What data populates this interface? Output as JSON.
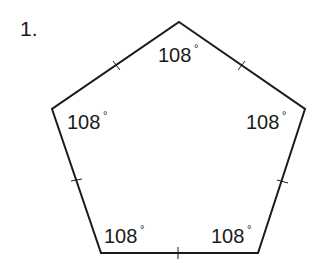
{
  "problem": {
    "number": "1."
  },
  "figure": {
    "shape": "regular pentagon",
    "stroke_color": "#1a1a1a",
    "background": "#ffffff",
    "angles": [
      {
        "vertex": "top",
        "value": "108",
        "unit": "°"
      },
      {
        "vertex": "left",
        "value": "108",
        "unit": "°"
      },
      {
        "vertex": "right",
        "value": "108",
        "unit": "°"
      },
      {
        "vertex": "bottom-left",
        "value": "108",
        "unit": "°"
      },
      {
        "vertex": "bottom-right",
        "value": "108",
        "unit": "°"
      }
    ],
    "congruence_tick_marks": 5
  }
}
